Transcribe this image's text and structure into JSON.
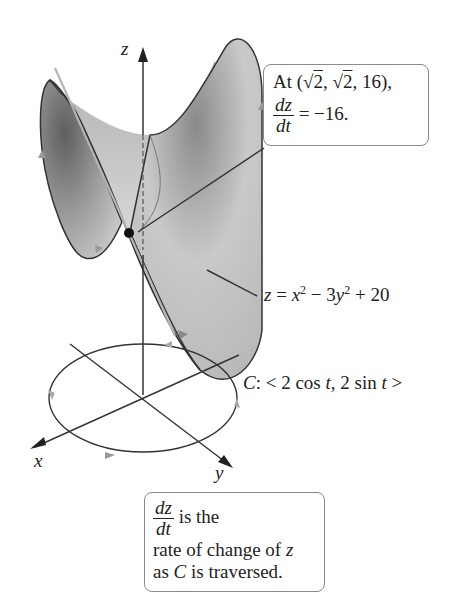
{
  "figure": {
    "axes": {
      "x_label": "x",
      "y_label": "y",
      "z_label": "z"
    },
    "surface_label": {
      "lhs": "z",
      "eq": " = ",
      "x": "x",
      "sup1": "2",
      "minus": " − 3",
      "y": "y",
      "sup2": "2",
      "rest": " + 20"
    },
    "curve_label": {
      "c": "C",
      "text1": ": < 2 cos ",
      "t1": "t",
      "text2": ", 2 sin ",
      "t2": "t",
      "text3": " >"
    },
    "point_callout": {
      "line1_prefix": "At (",
      "sqrt1": "2",
      "sep": ", ",
      "sqrt2": "2",
      "line1_suffix": ", 16),",
      "frac_num": "dz",
      "frac_den": "dt",
      "value": " = −16."
    },
    "bottom_callout": {
      "frac_num": "dz",
      "frac_den": "dt",
      "line1": " is the",
      "line2_prefix": "rate of change of ",
      "line2_var": "z",
      "line3_prefix": "as ",
      "line3_var": "C",
      "line3_suffix": " is traversed."
    },
    "colors": {
      "surface_light": "#d8d8d8",
      "surface_dark": "#6e6e6e",
      "stroke": "#333333",
      "tangent": "#b8b8b8",
      "callout_border": "#8a8a8a"
    }
  }
}
